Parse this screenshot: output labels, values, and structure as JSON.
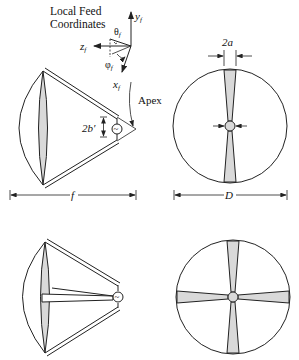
{
  "coordinates": {
    "title_line1": "Local Feed",
    "title_line2": "Coordinates",
    "y_axis": "y",
    "z_axis": "z",
    "x_axis": "x",
    "subscript": "f",
    "theta": "θ",
    "phi": "φ"
  },
  "labels": {
    "apex": "Apex",
    "gap": "2b′",
    "width": "2a",
    "focal_length": "f",
    "diameter": "D",
    "source": "~"
  },
  "colors": {
    "line": "#222222",
    "fill": "#d9d9d9"
  }
}
